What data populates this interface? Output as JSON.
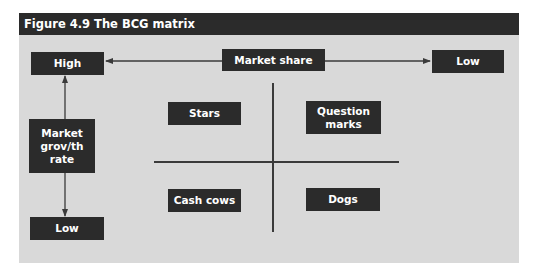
{
  "figure": {
    "title": "Figure 4.9 The BCG matrix"
  },
  "axes": {
    "horizontal": {
      "label": "Market share",
      "left_end": "High",
      "right_end": "Low"
    },
    "vertical": {
      "label_lines": [
        "Market",
        "grov/th",
        "rate"
      ],
      "top_end": "High",
      "bottom_end": "Low"
    }
  },
  "quadrants": {
    "top_left": "Stars",
    "top_right_lines": [
      "Question",
      "marks"
    ],
    "bottom_left": "Cash cows",
    "bottom_right": "Dogs"
  },
  "colors": {
    "box": "#2b2b2b",
    "background": "#d9d9d9",
    "line": "#3a3a3a"
  }
}
